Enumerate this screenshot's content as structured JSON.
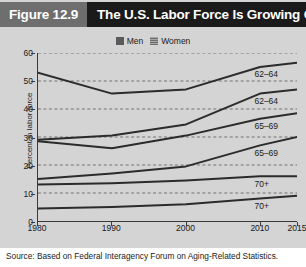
{
  "header": {
    "figure_number": "Figure 12.9",
    "title": "The U.S. Labor Force Is Growing Older"
  },
  "legend": {
    "position": "top-center",
    "items": [
      {
        "label": "Men",
        "swatch": "men-swatch",
        "color": "#5a5a5a"
      },
      {
        "label": "Women",
        "swatch": "women-swatch",
        "color": "#8d8d8d"
      }
    ]
  },
  "source": "Source: Based on Federal Interagency Forum on Aging-Related Statistics.",
  "chart_data": {
    "type": "line",
    "title": "The U.S. Labor Force Is Growing Older",
    "xlabel": "",
    "ylabel": "Percent in labor force",
    "xlim": [
      1980,
      2015
    ],
    "ylim": [
      0,
      60
    ],
    "grid": true,
    "grid_axis": "y",
    "x": [
      1980,
      1990,
      2000,
      2010,
      2015
    ],
    "xticks": [
      "1980",
      "1990",
      "2000",
      "2010",
      "2015"
    ],
    "yticks": [
      "0",
      "10",
      "20",
      "30",
      "40",
      "50",
      "60"
    ],
    "series": [
      {
        "name": "Men 62-64",
        "group": "Men",
        "age": "62–64",
        "label": "62–64",
        "values": [
          53.0,
          45.5,
          47.0,
          55.0,
          56.5
        ]
      },
      {
        "name": "Women 62-64",
        "group": "Women",
        "age": "62–64",
        "label": "62–64",
        "values": [
          29.0,
          30.5,
          34.5,
          45.5,
          47.0
        ]
      },
      {
        "name": "Men 65-69",
        "group": "Men",
        "age": "65–69",
        "label": "65–69",
        "values": [
          28.5,
          26.0,
          30.5,
          36.5,
          38.5
        ]
      },
      {
        "name": "Women 65-69",
        "group": "Women",
        "age": "65–69",
        "label": "65–69",
        "values": [
          15.0,
          17.0,
          19.5,
          27.0,
          30.0
        ]
      },
      {
        "name": "Men 70+",
        "group": "Men",
        "age": "70+",
        "label": "70+",
        "values": [
          13.0,
          13.5,
          14.5,
          16.0,
          16.0
        ]
      },
      {
        "name": "Women 70+",
        "group": "Women",
        "age": "70+",
        "label": "70+",
        "values": [
          4.5,
          5.0,
          6.0,
          8.0,
          9.0
        ]
      }
    ],
    "series_labels": [
      {
        "text": "62–64",
        "series": "Men 62-64",
        "y_value": 55.0
      },
      {
        "text": "62–64",
        "series": "Women 62-64",
        "y_value": 45.5
      },
      {
        "text": "65–69",
        "series": "Men 65-69",
        "y_value": 36.5
      },
      {
        "text": "65–69",
        "series": "Women 65-69",
        "y_value": 27.0
      },
      {
        "text": "70+",
        "series": "Men 70+",
        "y_value": 16.0
      },
      {
        "text": "70+",
        "series": "Women 70+",
        "y_value": 8.0
      }
    ]
  }
}
